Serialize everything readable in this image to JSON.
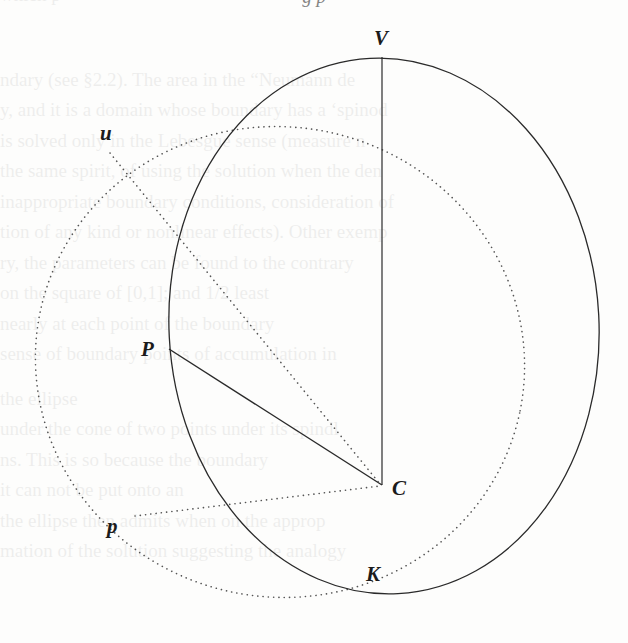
{
  "figure": {
    "type": "geometric-diagram",
    "labels": {
      "V": "V",
      "u": "u",
      "P": "P",
      "C": "C",
      "p": "p",
      "K": "K"
    },
    "colors": {
      "ink": "#2a2a2a",
      "dotted": "#555555",
      "paper": "#fdfdfc"
    },
    "points": {
      "V": [
        382,
        57
      ],
      "C": [
        382,
        485
      ],
      "P": [
        169,
        349
      ],
      "u": [
        110,
        153
      ],
      "p": [
        135,
        516
      ],
      "K": [
        392,
        594
      ]
    },
    "solid_ellipse": {
      "cx": 384,
      "cy": 326,
      "rx": 215,
      "ry": 268,
      "rotate": -3
    },
    "dotted_ellipse": {
      "cx": 280,
      "cy": 362,
      "rx": 245,
      "ry": 235,
      "rotate": 12
    },
    "solid_segments": [
      [
        "V",
        "C"
      ],
      [
        "P",
        "C"
      ]
    ],
    "dotted_segments": [
      [
        "u",
        "C"
      ],
      [
        "p",
        "C"
      ]
    ]
  },
  "header_fragment": "g p",
  "bleed_through_lines": [
    "                            which     p",
    "ndary (see §2.2). The area in the “Neumann de",
    "y, and it is a domain whose boundary has a ‘spinod",
    "is solved only in the Lebesgue sense (measure n",
    "the same spirit, of using the solution when the den",
    "inappropriate boundary conditions, consideration of",
    "tion of any kind or nonlinear effects). Other exemp",
    "ry, the parameters can be found to the contrary",
    "        on the square of [0,1]; and     1/2 least",
    "         nearly at each point of the boundary",
    "        sense of boundary points of accumulation in",
    "                           the ellipse",
    "      under the cone of two points under its spindl",
    "       ns. This is so because the boundary",
    "                    it can not be put onto an",
    "    the ellipse then admits when on the approp",
    "       mation of the solution suggesting the analogy"
  ]
}
